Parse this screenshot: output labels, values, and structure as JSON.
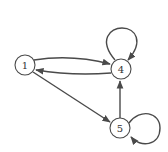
{
  "diagram": {
    "type": "directed-graph",
    "colors": {
      "stroke": "#4a4a4a",
      "node_fill": "#ffffff",
      "background": "#ffffff"
    },
    "nodes": [
      {
        "id": "1",
        "label": "1"
      },
      {
        "id": "4",
        "label": "4"
      },
      {
        "id": "5",
        "label": "5"
      }
    ],
    "edges": [
      {
        "from": "1",
        "to": "4"
      },
      {
        "from": "4",
        "to": "1"
      },
      {
        "from": "1",
        "to": "5"
      },
      {
        "from": "5",
        "to": "4"
      },
      {
        "from": "4",
        "to": "4"
      },
      {
        "from": "5",
        "to": "5"
      }
    ]
  }
}
